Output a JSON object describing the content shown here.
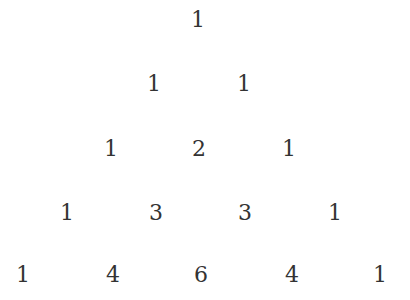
{
  "rows": [
    {
      "values": [
        "1"
      ]
    },
    {
      "values": [
        "1",
        "1"
      ]
    },
    {
      "values": [
        "1",
        "2",
        "1"
      ]
    },
    {
      "values": [
        "1",
        "3",
        "3",
        "1"
      ]
    },
    {
      "values": [
        "1",
        "4",
        "6",
        "4",
        "1"
      ]
    }
  ]
}
